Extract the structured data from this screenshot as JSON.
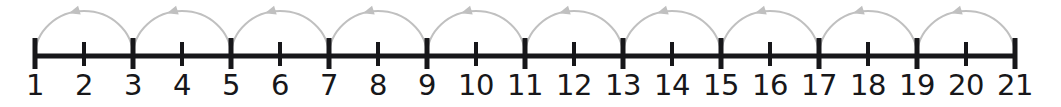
{
  "figure": {
    "background_color": "#ffffff",
    "width": 1061,
    "height": 107
  },
  "chart_data": {
    "type": "numberline",
    "xlabel": "",
    "ylabel": "",
    "axis_range": [
      1,
      21
    ],
    "tick_values": [
      1,
      2,
      3,
      4,
      5,
      6,
      7,
      8,
      9,
      10,
      11,
      12,
      13,
      14,
      15,
      16,
      17,
      18,
      19,
      20,
      21
    ],
    "tick_labels": [
      "1",
      "2",
      "3",
      "4",
      "5",
      "6",
      "7",
      "8",
      "9",
      "10",
      "11",
      "12",
      "13",
      "14",
      "15",
      "16",
      "17",
      "18",
      "19",
      "20",
      "21"
    ],
    "major_ticks": [
      1,
      3,
      5,
      7,
      9,
      11,
      13,
      15,
      17,
      19,
      21
    ],
    "minor_ticks": [
      2,
      4,
      6,
      8,
      10,
      12,
      14,
      16,
      18,
      20
    ],
    "jump_size": 2,
    "jumps": [
      {
        "from": 1,
        "to": 3
      },
      {
        "from": 3,
        "to": 5
      },
      {
        "from": 5,
        "to": 7
      },
      {
        "from": 7,
        "to": 9
      },
      {
        "from": 9,
        "to": 11
      },
      {
        "from": 11,
        "to": 13
      },
      {
        "from": 13,
        "to": 15
      },
      {
        "from": 15,
        "to": 17
      },
      {
        "from": 17,
        "to": 19
      },
      {
        "from": 19,
        "to": 21
      }
    ],
    "jump_direction": "right",
    "grid": false,
    "legend": null
  },
  "style": {
    "line_color": "#17171a",
    "tick_color": "#17171a",
    "label_color": "#17171a",
    "arc_color": "#c0c0c0",
    "arrow_color": "#c0c0c0"
  },
  "geometry": {
    "axis_y": 56,
    "x_start": 35,
    "x_end": 1015,
    "spacing": 49,
    "axis_thickness": 5,
    "major_tick_up": 18,
    "major_tick_down": 13,
    "minor_tick_up": 14,
    "minor_tick_down": 10,
    "arc_apex_rise": 45,
    "label_y": 71
  }
}
